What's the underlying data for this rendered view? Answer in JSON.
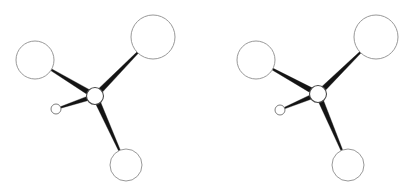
{
  "figure": {
    "kind": "ball-and-stick stereo pair",
    "background_color": "#ffffff",
    "width": 412,
    "height": 189,
    "view_count": 2,
    "view_labels": [
      "left-eye view",
      "right-eye view"
    ]
  },
  "style": {
    "sphere_fill": "#ffffff",
    "sphere_outline_color": "#8d8d8d",
    "center_outline_color": "#4a4a4a",
    "bond_color": "#141414",
    "sphere_outline_width": 0.9,
    "bond_taper": "wide-at-center"
  },
  "chart_data": {
    "type": "scatter",
    "xlabel": "",
    "ylabel": "",
    "xlim": [
      0,
      412
    ],
    "ylim": [
      0,
      189
    ],
    "grid": false,
    "legend": "none",
    "views": [
      {
        "name": "left-eye view",
        "atoms": [
          {
            "id": "C",
            "role": "center",
            "cx": 95,
            "cy": 96,
            "r": 8.5
          },
          {
            "id": "A1",
            "role": "substituent-upper-left",
            "cx": 35,
            "cy": 60,
            "r": 19
          },
          {
            "id": "A2",
            "role": "substituent-upper-right",
            "cx": 153,
            "cy": 37,
            "r": 22
          },
          {
            "id": "A3",
            "role": "substituent-lower-right",
            "cx": 126,
            "cy": 165,
            "r": 16
          },
          {
            "id": "A4",
            "role": "substituent-left-small",
            "cx": 56,
            "cy": 109,
            "r": 5
          }
        ],
        "bonds": [
          {
            "from": "C",
            "to": "A1",
            "half_width_center": 2.6,
            "half_width_end": 0.9
          },
          {
            "from": "C",
            "to": "A2",
            "half_width_center": 2.6,
            "half_width_end": 0.9
          },
          {
            "from": "C",
            "to": "A3",
            "half_width_center": 2.6,
            "half_width_end": 0.9
          },
          {
            "from": "C",
            "to": "A4",
            "half_width_center": 2.2,
            "half_width_end": 0.7
          }
        ]
      },
      {
        "name": "right-eye view",
        "atoms": [
          {
            "id": "C",
            "role": "center",
            "cx": 318,
            "cy": 94,
            "r": 8.5
          },
          {
            "id": "A1",
            "role": "substituent-upper-left",
            "cx": 256,
            "cy": 60,
            "r": 19
          },
          {
            "id": "A2",
            "role": "substituent-upper-right",
            "cx": 376,
            "cy": 37,
            "r": 22
          },
          {
            "id": "A3",
            "role": "substituent-lower-right",
            "cx": 348,
            "cy": 165,
            "r": 16
          },
          {
            "id": "A4",
            "role": "substituent-left-small",
            "cx": 280,
            "cy": 110,
            "r": 5
          }
        ],
        "bonds": [
          {
            "from": "C",
            "to": "A1",
            "half_width_center": 2.6,
            "half_width_end": 0.9
          },
          {
            "from": "C",
            "to": "A2",
            "half_width_center": 2.6,
            "half_width_end": 0.9
          },
          {
            "from": "C",
            "to": "A3",
            "half_width_center": 2.6,
            "half_width_end": 0.9
          },
          {
            "from": "C",
            "to": "A4",
            "half_width_center": 2.2,
            "half_width_end": 0.7
          }
        ]
      }
    ]
  }
}
